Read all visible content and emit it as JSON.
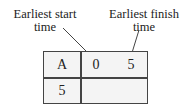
{
  "labels": {
    "earliest_start": [
      "Earliest start",
      "time"
    ],
    "earliest_finish": [
      "Earliest finish",
      "time"
    ]
  },
  "node": {
    "activity": "A",
    "duration": "5",
    "earliest_start": "0",
    "earliest_finish": "5"
  },
  "colors": {
    "line": "#444444",
    "node_fill": "#f4f4f4",
    "text": "#222222"
  }
}
